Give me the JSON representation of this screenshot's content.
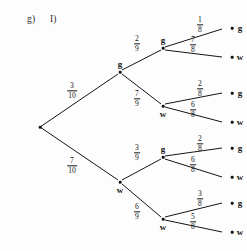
{
  "header": {
    "part_label": "g)",
    "sub_label": "I)"
  },
  "diagram": {
    "type": "probability-tree",
    "root": {
      "x": 40,
      "y": 127,
      "label": ""
    },
    "nodes": [
      {
        "id": "g1",
        "label": "g",
        "x": 120,
        "y": 72,
        "label_pos": "above"
      },
      {
        "id": "w1",
        "label": "w",
        "x": 120,
        "y": 182,
        "label_pos": "below"
      },
      {
        "id": "gg",
        "label": "g",
        "x": 163,
        "y": 48,
        "label_pos": "above"
      },
      {
        "id": "gw",
        "label": "w",
        "x": 163,
        "y": 106,
        "label_pos": "below"
      },
      {
        "id": "wg",
        "label": "g",
        "x": 163,
        "y": 157,
        "label_pos": "above"
      },
      {
        "id": "ww",
        "label": "w",
        "x": 163,
        "y": 219,
        "label_pos": "below"
      },
      {
        "id": "ggg",
        "label": "g",
        "x": 232,
        "y": 28,
        "label_pos": "right"
      },
      {
        "id": "ggw",
        "label": "w",
        "x": 232,
        "y": 57,
        "label_pos": "right"
      },
      {
        "id": "gwg",
        "label": "g",
        "x": 232,
        "y": 93,
        "label_pos": "right"
      },
      {
        "id": "gww",
        "label": "w",
        "x": 232,
        "y": 122,
        "label_pos": "right"
      },
      {
        "id": "wgg",
        "label": "g",
        "x": 232,
        "y": 148,
        "label_pos": "right"
      },
      {
        "id": "wgw",
        "label": "w",
        "x": 232,
        "y": 177,
        "label_pos": "right"
      },
      {
        "id": "wwg",
        "label": "g",
        "x": 232,
        "y": 203,
        "label_pos": "right"
      },
      {
        "id": "www",
        "label": "w",
        "x": 232,
        "y": 232,
        "label_pos": "right"
      }
    ],
    "edges": [
      {
        "from": "root",
        "to": "g1",
        "x1": 40,
        "y1": 127,
        "x2": 118,
        "y2": 74,
        "num": "3",
        "den": "10",
        "lx": 72,
        "ly": 91
      },
      {
        "from": "root",
        "to": "w1",
        "x1": 40,
        "y1": 127,
        "x2": 118,
        "y2": 180,
        "num": "7",
        "den": "10",
        "lx": 72,
        "ly": 166
      },
      {
        "from": "g1",
        "to": "gg",
        "x1": 122,
        "y1": 70,
        "x2": 161,
        "y2": 50,
        "num": "2",
        "den": "9",
        "lx": 137,
        "ly": 44
      },
      {
        "from": "g1",
        "to": "gw",
        "x1": 122,
        "y1": 74,
        "x2": 161,
        "y2": 104,
        "num": "7",
        "den": "9",
        "lx": 137,
        "ly": 99
      },
      {
        "from": "w1",
        "to": "wg",
        "x1": 122,
        "y1": 180,
        "x2": 161,
        "y2": 159,
        "num": "3",
        "den": "9",
        "lx": 137,
        "ly": 153
      },
      {
        "from": "w1",
        "to": "ww",
        "x1": 122,
        "y1": 184,
        "x2": 161,
        "y2": 217,
        "num": "6",
        "den": "9",
        "lx": 137,
        "ly": 212
      },
      {
        "from": "gg",
        "to": "ggg",
        "x1": 165,
        "y1": 47,
        "x2": 222,
        "y2": 29,
        "num": "1",
        "den": "8",
        "lx": 200,
        "ly": 25
      },
      {
        "from": "gg",
        "to": "ggw",
        "x1": 165,
        "y1": 50,
        "x2": 222,
        "y2": 57,
        "num": "7",
        "den": "8",
        "lx": 193,
        "ly": 45
      },
      {
        "from": "gw",
        "to": "gwg",
        "x1": 165,
        "y1": 104,
        "x2": 222,
        "y2": 93,
        "num": "2",
        "den": "8",
        "lx": 200,
        "ly": 89
      },
      {
        "from": "gw",
        "to": "gww",
        "x1": 165,
        "y1": 107,
        "x2": 222,
        "y2": 122,
        "num": "6",
        "den": "8",
        "lx": 193,
        "ly": 110
      },
      {
        "from": "wg",
        "to": "wgg",
        "x1": 165,
        "y1": 156,
        "x2": 222,
        "y2": 148,
        "num": "2",
        "den": "8",
        "lx": 200,
        "ly": 144
      },
      {
        "from": "wg",
        "to": "wgw",
        "x1": 165,
        "y1": 159,
        "x2": 222,
        "y2": 177,
        "num": "6",
        "den": "8",
        "lx": 193,
        "ly": 165
      },
      {
        "from": "ww",
        "to": "wwg",
        "x1": 165,
        "y1": 217,
        "x2": 222,
        "y2": 203,
        "num": "3",
        "den": "8",
        "lx": 200,
        "ly": 199
      },
      {
        "from": "ww",
        "to": "www",
        "x1": 165,
        "y1": 220,
        "x2": 222,
        "y2": 232,
        "num": "5",
        "den": "8",
        "lx": 193,
        "ly": 222
      }
    ],
    "colors": {
      "ink": "#151515",
      "background": "#fdfdfd"
    }
  }
}
